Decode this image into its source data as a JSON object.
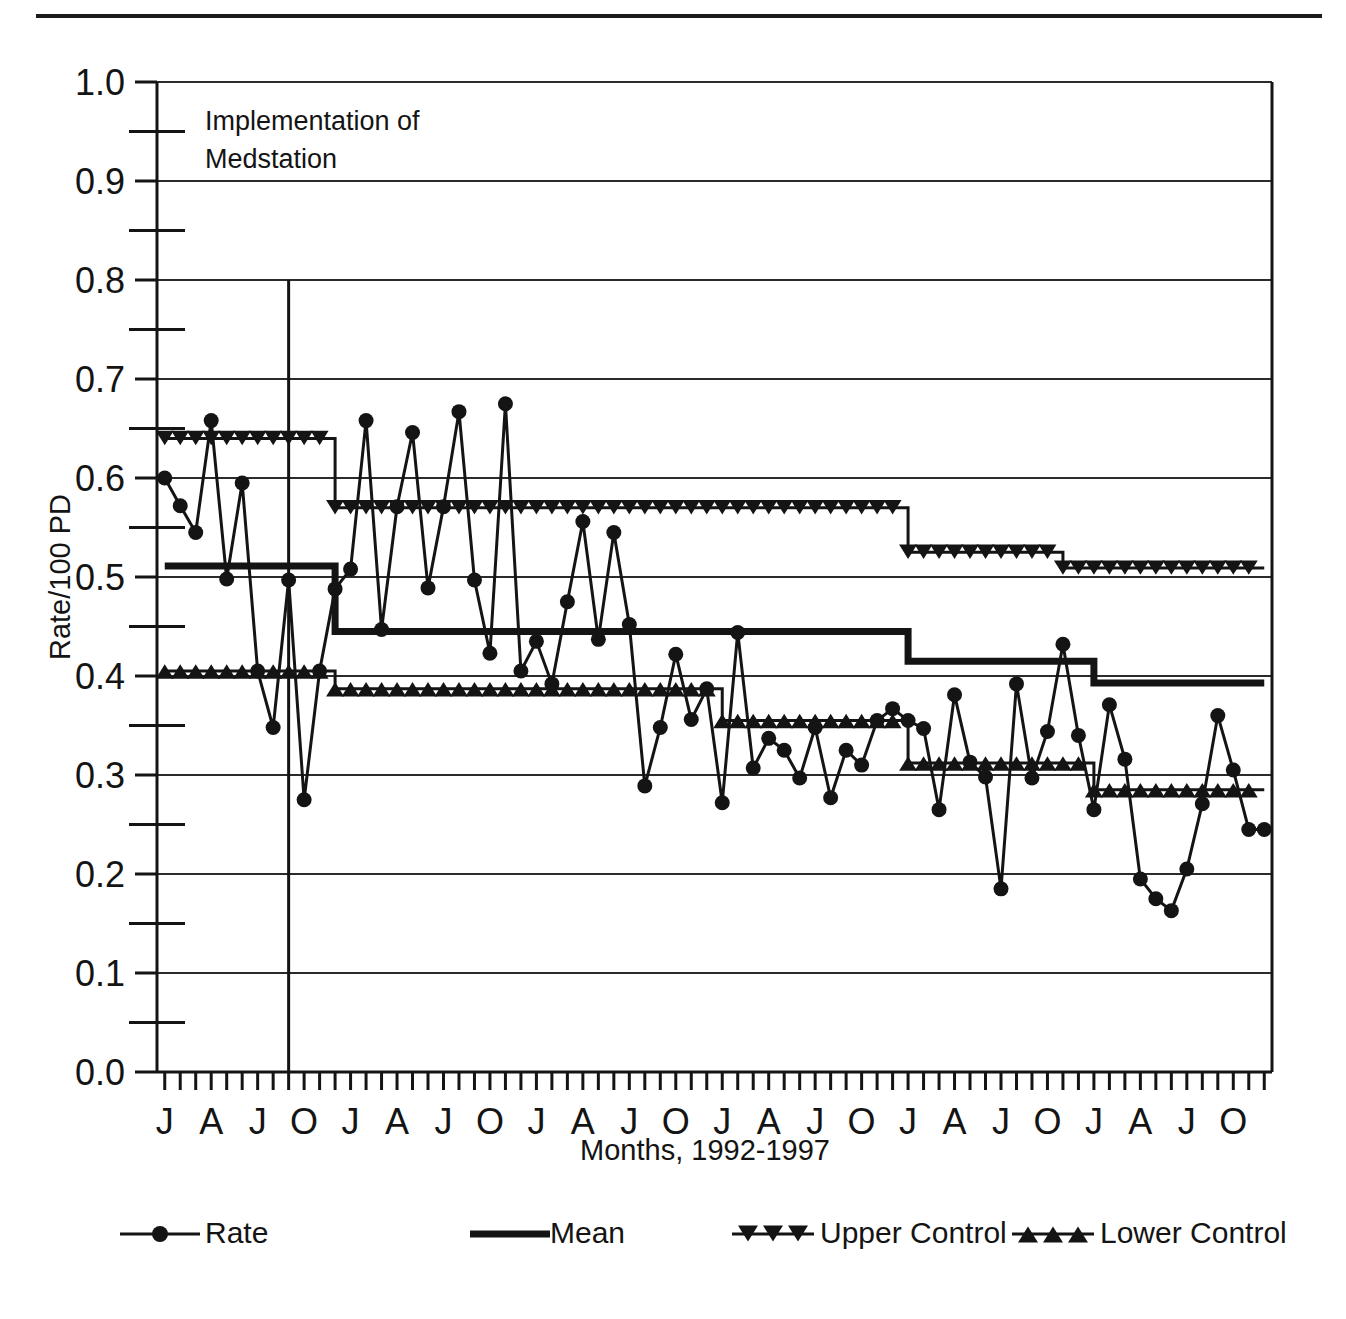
{
  "figure": {
    "kind": "statistical-process-control-chart",
    "has_top_rule": true
  },
  "annotation": {
    "line1": "Implementation of",
    "line2": "Medstation",
    "marker_month_index": 8,
    "marker_top_value": 0.8
  },
  "legend": {
    "items": [
      {
        "key": "rate",
        "label": "Rate",
        "marker": "circle-marker"
      },
      {
        "key": "mean",
        "label": "Mean",
        "marker": "thick-line"
      },
      {
        "key": "ucl",
        "label": "Upper Control",
        "marker": "down-triangle-marker"
      },
      {
        "key": "lcl",
        "label": "Lower Control",
        "marker": "up-triangle-marker"
      }
    ]
  },
  "chart_data": {
    "type": "line",
    "title": "",
    "xlabel": "Months, 1992-1997",
    "ylabel": "Rate/100 PD",
    "ylim": [
      0.0,
      1.0
    ],
    "ytick_step": 0.1,
    "yminor_step": 0.05,
    "grid": true,
    "grid_axis": "y",
    "legend_position": "bottom",
    "yticks": [
      "0.0",
      "0.1",
      "0.2",
      "0.3",
      "0.4",
      "0.5",
      "0.6",
      "0.7",
      "0.8",
      "0.9",
      "1.0"
    ],
    "x_count": 66,
    "xticklabels": [
      {
        "index": 0,
        "label": "J"
      },
      {
        "index": 3,
        "label": "A"
      },
      {
        "index": 6,
        "label": "J"
      },
      {
        "index": 9,
        "label": "O"
      },
      {
        "index": 12,
        "label": "J"
      },
      {
        "index": 15,
        "label": "A"
      },
      {
        "index": 18,
        "label": "J"
      },
      {
        "index": 21,
        "label": "O"
      },
      {
        "index": 24,
        "label": "J"
      },
      {
        "index": 27,
        "label": "A"
      },
      {
        "index": 30,
        "label": "J"
      },
      {
        "index": 33,
        "label": "O"
      },
      {
        "index": 36,
        "label": "J"
      },
      {
        "index": 39,
        "label": "A"
      },
      {
        "index": 42,
        "label": "J"
      },
      {
        "index": 45,
        "label": "O"
      },
      {
        "index": 48,
        "label": "J"
      },
      {
        "index": 51,
        "label": "A"
      },
      {
        "index": 54,
        "label": "J"
      },
      {
        "index": 57,
        "label": "O"
      },
      {
        "index": 60,
        "label": "J"
      },
      {
        "index": 63,
        "label": "A"
      },
      {
        "index": 66,
        "label": "J"
      },
      {
        "index": 69,
        "label": "O"
      }
    ],
    "series": [
      {
        "name": "Rate",
        "style": "line-with-circle-markers",
        "values": [
          0.6,
          0.572,
          0.545,
          0.658,
          0.498,
          0.595,
          0.405,
          0.348,
          0.497,
          0.275,
          0.405,
          0.488,
          0.508,
          0.658,
          0.447,
          0.571,
          0.646,
          0.489,
          0.571,
          0.667,
          0.497,
          0.423,
          0.675,
          0.405,
          0.435,
          0.392,
          0.475,
          0.556,
          0.437,
          0.545,
          0.452,
          0.289,
          0.348,
          0.422,
          0.356,
          0.387,
          0.272,
          0.444,
          0.307,
          0.337,
          0.325,
          0.297,
          0.348,
          0.277,
          0.325,
          0.31,
          0.355,
          0.367,
          0.355,
          0.347,
          0.265,
          0.381,
          0.313,
          0.298,
          0.185,
          0.392,
          0.297,
          0.344,
          0.432,
          0.34,
          0.265,
          0.371,
          0.316,
          0.195,
          0.175,
          0.163,
          0.205,
          0.271,
          0.36,
          0.305,
          0.245,
          0.245
        ]
      },
      {
        "name": "Mean",
        "style": "thick-step-line",
        "segments": [
          {
            "start": 0,
            "end": 11,
            "value": 0.511
          },
          {
            "start": 11,
            "end": 36,
            "value": 0.445
          },
          {
            "start": 36,
            "end": 48,
            "value": 0.445
          },
          {
            "start": 48,
            "end": 60,
            "value": 0.415
          },
          {
            "start": 60,
            "end": 71,
            "value": 0.393
          }
        ]
      },
      {
        "name": "Upper Control",
        "style": "step-line-with-down-triangles",
        "segments": [
          {
            "start": 0,
            "end": 11,
            "value": 0.64
          },
          {
            "start": 11,
            "end": 48,
            "value": 0.57
          },
          {
            "start": 48,
            "end": 58,
            "value": 0.525
          },
          {
            "start": 58,
            "end": 71,
            "value": 0.509
          }
        ]
      },
      {
        "name": "Lower Control",
        "style": "step-line-with-up-triangles",
        "segments": [
          {
            "start": 0,
            "end": 11,
            "value": 0.405
          },
          {
            "start": 11,
            "end": 36,
            "value": 0.387
          },
          {
            "start": 36,
            "end": 48,
            "value": 0.355
          },
          {
            "start": 48,
            "end": 60,
            "value": 0.312
          },
          {
            "start": 60,
            "end": 71,
            "value": 0.285
          }
        ]
      }
    ]
  },
  "colors": {
    "ink": "#141414",
    "grid": "#2b2b2b",
    "background": "#ffffff"
  }
}
